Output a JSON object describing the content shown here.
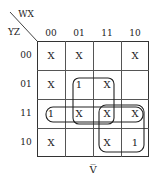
{
  "kmap": {
    "corner_col_var": "WX",
    "corner_row_var": "YZ",
    "col_headers": [
      "00",
      "01",
      "11",
      "10"
    ],
    "row_headers": [
      "00",
      "01",
      "11",
      "10"
    ],
    "cells": [
      [
        "X",
        "X",
        "",
        "X"
      ],
      [
        "X",
        "1",
        "X",
        ""
      ],
      [
        "1",
        "X",
        "X",
        "X"
      ],
      [
        "X",
        "",
        "X",
        "1"
      ]
    ],
    "caption": "V̅",
    "groups": [
      {
        "name": "vertical-group-col01-col11-rows01-11",
        "cells": [
          [
            1,
            1
          ],
          [
            1,
            2
          ],
          [
            2,
            1
          ],
          [
            2,
            2
          ]
        ]
      },
      {
        "name": "horizontal-group-row11",
        "cells": [
          [
            2,
            0
          ],
          [
            2,
            1
          ],
          [
            2,
            2
          ],
          [
            2,
            3
          ]
        ]
      },
      {
        "name": "square-group-cols11-10-rows11-10",
        "cells": [
          [
            2,
            2
          ],
          [
            2,
            3
          ],
          [
            3,
            2
          ],
          [
            3,
            3
          ]
        ]
      }
    ]
  }
}
